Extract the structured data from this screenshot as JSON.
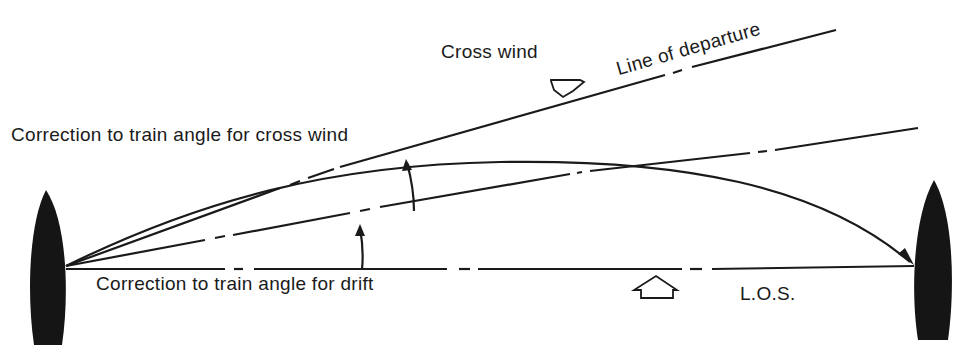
{
  "diagram": {
    "labels": {
      "cross_wind": "Cross wind",
      "line_of_departure": "Line of departure",
      "correction_cross_wind": "Correction to train angle for cross wind",
      "correction_drift": "Correction to train angle for drift",
      "los": "L.O.S."
    },
    "elements": {
      "firing_ship": "left vessel (plan view)",
      "target_ship": "right vessel (plan view)",
      "trajectory": "curved torpedo track from firing ship to target",
      "cross_wind_arrow": "down-pointing hollow arrow",
      "drift_arrow": "up-pointing hollow arrow"
    },
    "colors": {
      "ink": "#1a1a1a",
      "background": "#ffffff"
    }
  }
}
